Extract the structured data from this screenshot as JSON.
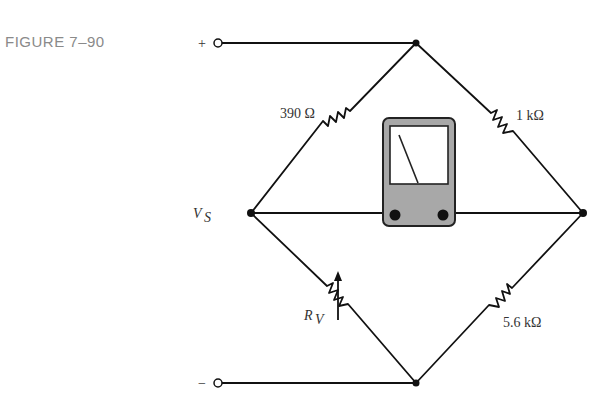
{
  "figure": {
    "label": "FIGURE 7–90"
  },
  "terminals": {
    "positive": "+",
    "negative": "−"
  },
  "source": {
    "label": "V",
    "subscript": "S"
  },
  "components": {
    "r_top_left": "390 Ω",
    "r_top_right": "1 kΩ",
    "r_bottom_left_label": "R",
    "r_bottom_left_subscript": "V",
    "r_bottom_right": "5.6 kΩ"
  },
  "meter": {
    "type": "galvanometer",
    "body_color": "#a8a8a8",
    "face_color": "#ffffff"
  },
  "colors": {
    "wire": "#111111",
    "figure_label": "#8a8a8a"
  }
}
